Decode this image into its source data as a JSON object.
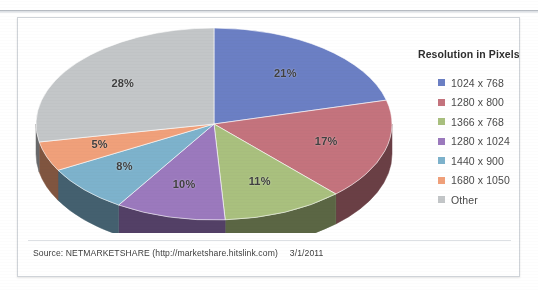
{
  "scan": {
    "top_cut_text": "",
    "page_bg": "#ffffff"
  },
  "frame": {
    "border_color": "#cfd3d8"
  },
  "legend": {
    "title": "Resolution in Pixels",
    "items": [
      {
        "label": "1024 x 768",
        "color": "#6b7fc4"
      },
      {
        "label": "1280 x 800",
        "color": "#c4737d"
      },
      {
        "label": "1366 x 768",
        "color": "#a9c07e"
      },
      {
        "label": "1280 x 1024",
        "color": "#9b79bd"
      },
      {
        "label": "1440 x 900",
        "color": "#7db2cc"
      },
      {
        "label": "1680 x 1050",
        "color": "#f0a07a"
      },
      {
        "label": "Other",
        "color": "#c3c6c8"
      }
    ]
  },
  "footer": {
    "source": "Source: NETMARKETSHARE (http://marketshare.hitslink.com)",
    "date": "3/1/2011"
  },
  "labels": {
    "p0": "21%",
    "p1": "17%",
    "p2": "11%",
    "p3": "10%",
    "p4": "8%",
    "p5": "5%",
    "p6": "28%"
  },
  "chart_data": {
    "type": "pie",
    "title": "",
    "subtitle": "",
    "legend_title": "Resolution in Pixels",
    "legend_position": "right",
    "three_d": true,
    "start_angle_deg": -90,
    "direction": "clockwise",
    "categories": [
      "1024 x 768",
      "1280 x 800",
      "1366 x 768",
      "1280 x 1024",
      "1440 x 900",
      "1680 x 1050",
      "Other"
    ],
    "values": [
      21,
      17,
      11,
      10,
      8,
      5,
      28
    ],
    "value_unit": "percent",
    "data_labels": [
      "21%",
      "17%",
      "11%",
      "10%",
      "8%",
      "5%",
      "28%"
    ],
    "colors": [
      "#6b7fc4",
      "#c4737d",
      "#a9c07e",
      "#9b79bd",
      "#7db2cc",
      "#f0a07a",
      "#c3c6c8"
    ],
    "side_colors": [
      "#3a4468",
      "#6a3f45",
      "#5b6644",
      "#534066",
      "#44606f",
      "#80553f",
      "#68696b"
    ],
    "total": 100,
    "source_note": "Source: NETMARKETSHARE (http://marketshare.hitslink.com)",
    "date": "3/1/2011",
    "xlabel": "",
    "ylabel": "",
    "grid": false
  }
}
